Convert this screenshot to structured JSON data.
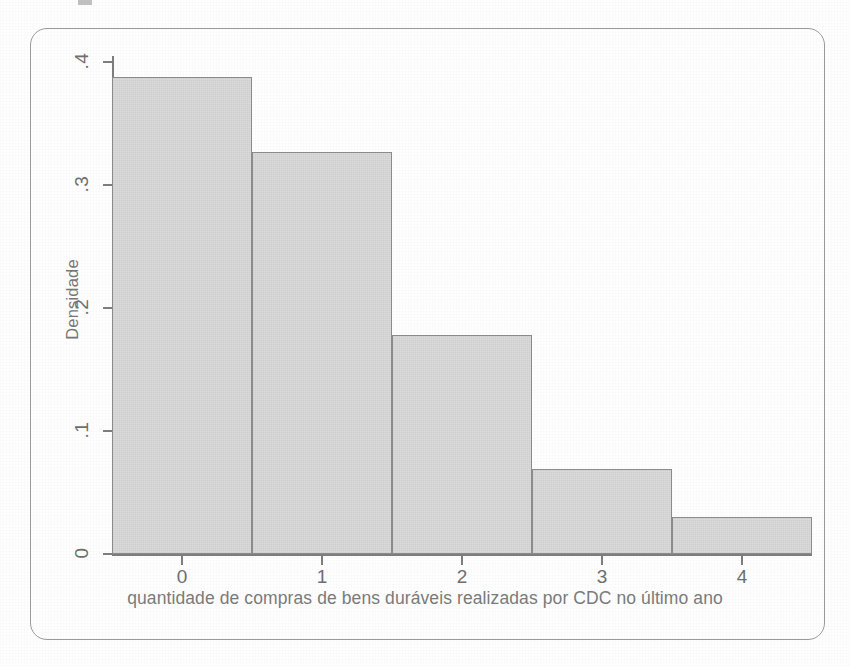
{
  "figure": {
    "frame_style": "rounded-rectangle-border",
    "border_color": "#9a9a9a",
    "background_color": "#fefefe"
  },
  "chart_data": {
    "type": "bar",
    "title": "",
    "subtitle": "",
    "xlabel": "quantidade de compras de bens duráveis realizadas por CDC no último ano",
    "ylabel": "Densidade",
    "categories": [
      "0",
      "1",
      "2",
      "3",
      "4"
    ],
    "values": [
      0.388,
      0.327,
      0.178,
      0.069,
      0.03
    ],
    "xlim": [
      -0.5,
      4.5
    ],
    "ylim": [
      0,
      0.4
    ],
    "xticks": [
      "0",
      "1",
      "2",
      "3",
      "4"
    ],
    "yticks": [
      "0",
      ".1",
      ".2",
      ".3",
      ".4"
    ],
    "ytick_values": [
      0,
      0.1,
      0.2,
      0.3,
      0.4
    ],
    "grid": false,
    "legend": false,
    "legend_position": "none",
    "bar_fill_color": "#dcdcdc",
    "bar_edge_color": "#8b8b8b",
    "axis_color": "#7d7d7d",
    "bar_width": 1.0,
    "note": "histograma de densidade, barras contíguas"
  }
}
